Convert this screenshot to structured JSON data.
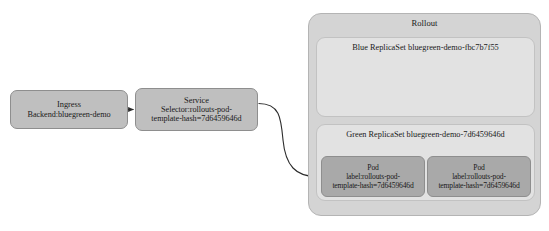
{
  "diagram": {
    "type": "kubernetes-blue-green-rollout",
    "caption": "",
    "colors": {
      "canvas": "#ffffff",
      "node_fill": "#bfbfbf",
      "node_stroke": "#8e8e8e",
      "container_fill": "#d4d4d4",
      "container_stroke": "#b4b4b4",
      "replicaset_fill": "#e2e2e2",
      "replicaset_stroke": "#c2c2c2",
      "pod_fill": "#a9a9a9",
      "pod_stroke": "#8e8e8e",
      "connector": "#2b2b2b",
      "text": "#1a1a1a"
    },
    "nodes": {
      "ingress": {
        "title": "Ingress",
        "detail": "Backend:bluegreen-demo"
      },
      "service": {
        "title": "Service",
        "detail_line1": "Selector:rollouts-pod-",
        "detail_line2": "template-hash=7d6459646d"
      },
      "rollout": {
        "title": "Rollout"
      },
      "blue_replicaset": {
        "title": "Blue ReplicaSet",
        "name": "bluegreen-demo-fbc7b7f55"
      },
      "green_replicaset": {
        "title": "Green ReplicaSet",
        "name": "bluegreen-demo-7d6459646d"
      },
      "pod_1": {
        "title": "Pod",
        "detail_line1": "label:rollouts-pod-",
        "detail_line2": "template-hash=7d6459646d"
      },
      "pod_2": {
        "title": "Pod",
        "detail_line1": "label:rollouts-pod-",
        "detail_line2": "template-hash=7d6459646d"
      }
    },
    "connectors": [
      {
        "name": "ingress-to-service",
        "from": "ingress",
        "to": "service",
        "style": "straight-arrow"
      },
      {
        "name": "service-to-pod",
        "from": "service",
        "to": "pod_1",
        "style": "curved-arrow"
      }
    ]
  }
}
